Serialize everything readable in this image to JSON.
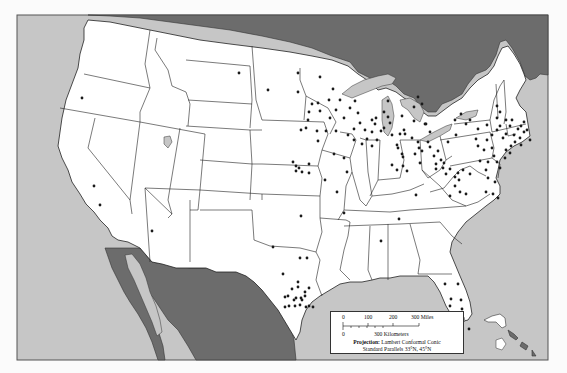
{
  "map": {
    "title": "United States point distribution map",
    "colors": {
      "water": "#c6c6c6",
      "us_land": "#ffffff",
      "foreign_land": "#6c6c6c",
      "border": "#222222",
      "dot": "#1a1a1a",
      "page": "#fbfbfb"
    },
    "frame": {
      "x": 17,
      "y": 15,
      "width": 531,
      "height": 345
    }
  },
  "legend": {
    "scale_miles_ticks": [
      "0",
      "100",
      "200",
      "300 Miles"
    ],
    "scale_km_ticks": [
      "0",
      "300 Kilometers"
    ],
    "projection_label": "Projection:",
    "projection_value": "Lambert Conformal Conic",
    "parallels": "Standard Parallels 33°N, 45°N"
  },
  "points": [
    [
      82,
      98
    ],
    [
      94,
      186
    ],
    [
      152,
      231
    ],
    [
      100,
      205
    ],
    [
      268,
      90
    ],
    [
      298,
      73
    ],
    [
      298,
      92
    ],
    [
      239,
      73
    ],
    [
      320,
      77
    ],
    [
      333,
      89
    ],
    [
      340,
      100
    ],
    [
      330,
      118
    ],
    [
      318,
      103
    ],
    [
      320,
      111
    ],
    [
      312,
      104
    ],
    [
      309,
      112
    ],
    [
      308,
      120
    ],
    [
      306,
      128
    ],
    [
      301,
      130
    ],
    [
      317,
      131
    ],
    [
      326,
      131
    ],
    [
      336,
      131
    ],
    [
      318,
      141
    ],
    [
      334,
      154
    ],
    [
      344,
      158
    ],
    [
      347,
      172
    ],
    [
      325,
      180
    ],
    [
      337,
      192
    ],
    [
      344,
      213
    ],
    [
      293,
      162
    ],
    [
      296,
      166
    ],
    [
      299,
      168
    ],
    [
      296,
      171
    ],
    [
      302,
      172
    ],
    [
      309,
      164
    ],
    [
      309,
      173
    ],
    [
      329,
      100
    ],
    [
      336,
      110
    ],
    [
      344,
      118
    ],
    [
      350,
      108
    ],
    [
      355,
      101
    ],
    [
      358,
      113
    ],
    [
      360,
      123
    ],
    [
      354,
      129
    ],
    [
      348,
      135
    ],
    [
      354,
      140
    ],
    [
      362,
      144
    ],
    [
      367,
      139
    ],
    [
      372,
      146
    ],
    [
      377,
      140
    ],
    [
      381,
      131
    ],
    [
      365,
      130
    ],
    [
      376,
      118
    ],
    [
      372,
      120
    ],
    [
      375,
      124
    ],
    [
      372,
      132
    ],
    [
      384,
      128
    ],
    [
      388,
      117
    ],
    [
      384,
      112
    ],
    [
      390,
      123
    ],
    [
      392,
      135
    ],
    [
      397,
      145
    ],
    [
      398,
      148
    ],
    [
      402,
      154
    ],
    [
      392,
      165
    ],
    [
      397,
      170
    ],
    [
      400,
      134
    ],
    [
      404,
      130
    ],
    [
      412,
      138
    ],
    [
      418,
      142
    ],
    [
      419,
      148
    ],
    [
      415,
      154
    ],
    [
      403,
      157
    ],
    [
      403,
      166
    ],
    [
      407,
      171
    ],
    [
      420,
      163
    ],
    [
      422,
      151
    ],
    [
      425,
      124
    ],
    [
      426,
      124
    ],
    [
      430,
      132
    ],
    [
      428,
      142
    ],
    [
      430,
      147
    ],
    [
      434,
      156
    ],
    [
      438,
      151
    ],
    [
      441,
      160
    ],
    [
      436,
      169
    ],
    [
      444,
      163
    ],
    [
      418,
      97
    ],
    [
      422,
      104
    ],
    [
      414,
      107
    ],
    [
      402,
      116
    ],
    [
      405,
      134
    ],
    [
      414,
      121
    ],
    [
      388,
      101
    ],
    [
      436,
      164
    ],
    [
      443,
      168
    ],
    [
      446,
      174
    ],
    [
      450,
      169
    ],
    [
      455,
      177
    ],
    [
      458,
      173
    ],
    [
      463,
      170
    ],
    [
      448,
      142
    ],
    [
      456,
      135
    ],
    [
      466,
      124
    ],
    [
      476,
      139
    ],
    [
      478,
      146
    ],
    [
      484,
      150
    ],
    [
      480,
      161
    ],
    [
      486,
      170
    ],
    [
      488,
      162
    ],
    [
      487,
      140
    ],
    [
      492,
      135
    ],
    [
      497,
      130
    ],
    [
      500,
      126
    ],
    [
      503,
      138
    ],
    [
      506,
      134
    ],
    [
      510,
      126
    ],
    [
      512,
      120
    ],
    [
      514,
      135
    ],
    [
      515,
      142
    ],
    [
      511,
      146
    ],
    [
      518,
      129
    ],
    [
      520,
      138
    ],
    [
      521,
      126
    ],
    [
      524,
      122
    ],
    [
      524,
      132
    ],
    [
      527,
      130
    ],
    [
      530,
      140
    ],
    [
      521,
      145
    ],
    [
      506,
      120
    ],
    [
      497,
      118
    ],
    [
      487,
      125
    ],
    [
      478,
      129
    ],
    [
      470,
      120
    ],
    [
      461,
      114
    ],
    [
      455,
      120
    ],
    [
      500,
      112
    ],
    [
      497,
      106
    ],
    [
      492,
      148
    ],
    [
      494,
      156
    ],
    [
      497,
      162
    ],
    [
      500,
      168
    ],
    [
      506,
      150
    ],
    [
      505,
      158
    ],
    [
      510,
      153
    ],
    [
      495,
      182
    ],
    [
      488,
      178
    ],
    [
      486,
      192
    ],
    [
      493,
      194
    ],
    [
      498,
      198
    ],
    [
      466,
      194
    ],
    [
      470,
      174
    ],
    [
      459,
      180
    ],
    [
      455,
      186
    ],
    [
      460,
      192
    ],
    [
      450,
      196
    ],
    [
      416,
      195
    ],
    [
      381,
      241
    ],
    [
      399,
      219
    ],
    [
      301,
      216
    ],
    [
      273,
      247
    ],
    [
      300,
      258
    ],
    [
      307,
      258
    ],
    [
      292,
      289
    ],
    [
      298,
      287
    ],
    [
      309,
      288
    ],
    [
      305,
      292
    ],
    [
      296,
      298
    ],
    [
      301,
      298
    ],
    [
      288,
      296
    ],
    [
      294,
      300
    ],
    [
      302,
      300
    ],
    [
      305,
      296
    ],
    [
      295,
      306
    ],
    [
      300,
      305
    ],
    [
      306,
      307
    ],
    [
      289,
      306
    ],
    [
      309,
      306
    ],
    [
      313,
      307
    ],
    [
      298,
      282
    ],
    [
      283,
      274
    ],
    [
      285,
      297
    ],
    [
      285,
      307
    ],
    [
      451,
      299
    ],
    [
      450,
      306
    ],
    [
      461,
      300
    ],
    [
      462,
      309
    ],
    [
      459,
      318
    ],
    [
      449,
      320
    ],
    [
      453,
      333
    ],
    [
      469,
      329
    ],
    [
      445,
      284
    ],
    [
      458,
      284
    ]
  ]
}
